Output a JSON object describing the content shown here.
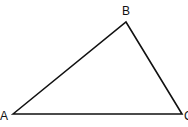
{
  "diagram": {
    "type": "triangle",
    "vertices": [
      {
        "label": "A",
        "x": 13,
        "y": 114
      },
      {
        "label": "B",
        "x": 126,
        "y": 22
      },
      {
        "label": "C",
        "x": 182,
        "y": 114
      }
    ],
    "stroke_color": "#111111"
  },
  "labels": {
    "a": "A",
    "b": "B",
    "c": "C"
  }
}
